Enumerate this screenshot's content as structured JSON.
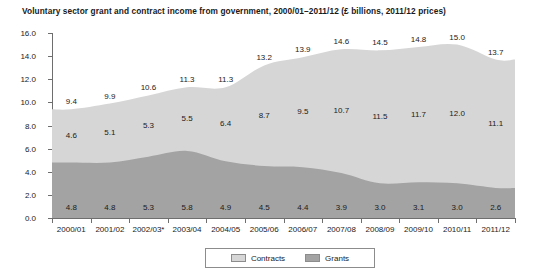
{
  "chart_data": {
    "type": "area",
    "title": "Voluntary sector grant and contract income from government, 2000/01–2011/12 (£ billions, 2011/12 prices)",
    "xlabel": "",
    "ylabel": "",
    "ylim": [
      0,
      16
    ],
    "ytick_step": 2,
    "yticks": [
      "0.0",
      "2.0",
      "4.0",
      "6.0",
      "8.0",
      "10.0",
      "12.0",
      "14.0",
      "16.0"
    ],
    "grid": false,
    "stacked": true,
    "legend_position": "bottom-center",
    "categories": [
      "2000/01",
      "2001/02",
      "2002/03*",
      "2003/04",
      "2004/05",
      "2005/06",
      "2006/07",
      "2007/08",
      "2008/09",
      "2009/10",
      "2010/11",
      "2011/12"
    ],
    "series": [
      {
        "name": "Grants",
        "color": "#a3a3a3",
        "values": [
          4.8,
          4.8,
          5.3,
          5.8,
          4.9,
          4.5,
          4.4,
          3.9,
          3.0,
          3.1,
          3.0,
          2.6
        ],
        "labels": [
          "4.8",
          "4.8",
          "5.3",
          "5.8",
          "4.9",
          "4.5",
          "4.4",
          "3.9",
          "3.0",
          "3.1",
          "3.0",
          "2.6"
        ]
      },
      {
        "name": "Contracts",
        "color": "#d6d6d6",
        "values": [
          4.6,
          5.1,
          5.3,
          5.5,
          6.4,
          8.7,
          9.5,
          10.7,
          11.5,
          11.7,
          12.0,
          11.1
        ],
        "labels": [
          "4.6",
          "5.1",
          "5.3",
          "5.5",
          "6.4",
          "8.7",
          "9.5",
          "10.7",
          "11.5",
          "11.7",
          "12.0",
          "11.1"
        ]
      }
    ],
    "totals": {
      "values": [
        9.4,
        9.9,
        10.6,
        11.3,
        11.3,
        13.2,
        13.9,
        14.6,
        14.5,
        14.8,
        15.0,
        13.7
      ],
      "labels": [
        "9.4",
        "9.9",
        "10.6",
        "11.3",
        "11.3",
        "13.2",
        "13.9",
        "14.6",
        "14.5",
        "14.8",
        "15.0",
        "13.7"
      ]
    }
  },
  "legend": {
    "items": [
      {
        "label": "Contracts",
        "color": "#d6d6d6"
      },
      {
        "label": "Grants",
        "color": "#a3a3a3"
      }
    ]
  }
}
